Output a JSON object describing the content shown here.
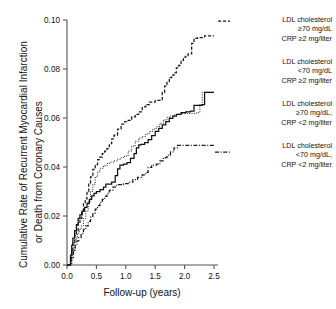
{
  "chart_data": {
    "type": "line",
    "title": "",
    "xlabel": "Follow-up (years)",
    "ylabel": "Cumulative Rate of Recurrent Myocardial Infarction or Death from Coronary Causes",
    "ylabel_line1": "Cumulative Rate of Recurrent Myocardial Infarction",
    "ylabel_line2": "or Death from Coronary Causes",
    "xlim": [
      0.0,
      2.5
    ],
    "ylim": [
      0.0,
      0.1
    ],
    "xticks": [
      "0.0",
      "0.5",
      "1.0",
      "1.5",
      "2.0",
      "2.5"
    ],
    "xtick_values": [
      0.0,
      0.5,
      1.0,
      1.5,
      2.0,
      2.5
    ],
    "yticks": [
      "0.00",
      "0.02",
      "0.04",
      "0.06",
      "0.08",
      "0.10"
    ],
    "ytick_values": [
      0.0,
      0.02,
      0.04,
      0.06,
      0.08,
      0.1
    ],
    "grid": false,
    "legend_position": "right",
    "series": [
      {
        "name": "LDL cholesterol >=70 mg/dL CRP >=2 mg/liter",
        "label_lines": [
          "LDL cholesterol",
          "≥70 mg/dL",
          "CRP ≥2 mg/liter"
        ],
        "style": "dashed",
        "color": "#1a1a1a",
        "final_value": 0.0935,
        "points": [
          [
            0.0,
            0.0
          ],
          [
            0.04,
            0.0
          ],
          [
            0.06,
            0.003
          ],
          [
            0.08,
            0.006
          ],
          [
            0.1,
            0.009
          ],
          [
            0.13,
            0.012
          ],
          [
            0.16,
            0.014
          ],
          [
            0.19,
            0.017
          ],
          [
            0.22,
            0.019
          ],
          [
            0.25,
            0.022
          ],
          [
            0.28,
            0.025
          ],
          [
            0.31,
            0.027
          ],
          [
            0.34,
            0.03
          ],
          [
            0.37,
            0.033
          ],
          [
            0.4,
            0.036
          ],
          [
            0.44,
            0.039
          ],
          [
            0.48,
            0.041
          ],
          [
            0.52,
            0.043
          ],
          [
            0.56,
            0.044
          ],
          [
            0.6,
            0.0455
          ],
          [
            0.64,
            0.0465
          ],
          [
            0.68,
            0.0475
          ],
          [
            0.72,
            0.0495
          ],
          [
            0.76,
            0.0515
          ],
          [
            0.8,
            0.053
          ],
          [
            0.86,
            0.0555
          ],
          [
            0.92,
            0.0575
          ],
          [
            0.98,
            0.0585
          ],
          [
            1.04,
            0.059
          ],
          [
            1.1,
            0.0605
          ],
          [
            1.16,
            0.0615
          ],
          [
            1.22,
            0.0625
          ],
          [
            1.28,
            0.0645
          ],
          [
            1.34,
            0.0655
          ],
          [
            1.4,
            0.0665
          ],
          [
            1.5,
            0.0672
          ],
          [
            1.58,
            0.0672
          ],
          [
            1.62,
            0.0705
          ],
          [
            1.66,
            0.073
          ],
          [
            1.7,
            0.0745
          ],
          [
            1.74,
            0.0765
          ],
          [
            1.78,
            0.0775
          ],
          [
            1.82,
            0.0785
          ],
          [
            1.86,
            0.0805
          ],
          [
            1.9,
            0.0815
          ],
          [
            1.94,
            0.0835
          ],
          [
            1.98,
            0.0848
          ],
          [
            2.02,
            0.0852
          ],
          [
            2.06,
            0.0862
          ],
          [
            2.1,
            0.0862
          ],
          [
            2.12,
            0.0905
          ],
          [
            2.16,
            0.0925
          ],
          [
            2.22,
            0.0928
          ],
          [
            2.3,
            0.0928
          ],
          [
            2.34,
            0.0935
          ],
          [
            2.5,
            0.0935
          ]
        ]
      },
      {
        "name": "LDL cholesterol <70 mg/dL CRP >=2 mg/liter",
        "label_lines": [
          "LDL cholesterol",
          "<70 mg/dL",
          "CRP ≥2 mg/liter"
        ],
        "style": "dotted",
        "color": "#1a1a1a",
        "final_value": 0.0705,
        "points": [
          [
            0.0,
            0.0
          ],
          [
            0.05,
            0.0
          ],
          [
            0.07,
            0.003
          ],
          [
            0.09,
            0.006
          ],
          [
            0.12,
            0.009
          ],
          [
            0.15,
            0.011
          ],
          [
            0.18,
            0.013
          ],
          [
            0.21,
            0.0145
          ],
          [
            0.24,
            0.016
          ],
          [
            0.28,
            0.019
          ],
          [
            0.32,
            0.022
          ],
          [
            0.36,
            0.026
          ],
          [
            0.4,
            0.03
          ],
          [
            0.44,
            0.033
          ],
          [
            0.48,
            0.036
          ],
          [
            0.52,
            0.038
          ],
          [
            0.56,
            0.0395
          ],
          [
            0.62,
            0.0405
          ],
          [
            0.68,
            0.0415
          ],
          [
            0.74,
            0.042
          ],
          [
            0.8,
            0.0425
          ],
          [
            0.86,
            0.0432
          ],
          [
            0.92,
            0.0438
          ],
          [
            0.98,
            0.0445
          ],
          [
            1.04,
            0.0465
          ],
          [
            1.1,
            0.0485
          ],
          [
            1.16,
            0.0505
          ],
          [
            1.22,
            0.0518
          ],
          [
            1.28,
            0.0525
          ],
          [
            1.34,
            0.0535
          ],
          [
            1.4,
            0.0545
          ],
          [
            1.46,
            0.0555
          ],
          [
            1.52,
            0.0565
          ],
          [
            1.58,
            0.0578
          ],
          [
            1.64,
            0.0592
          ],
          [
            1.7,
            0.0602
          ],
          [
            1.76,
            0.0608
          ],
          [
            1.82,
            0.0612
          ],
          [
            1.88,
            0.0615
          ],
          [
            1.96,
            0.0618
          ],
          [
            2.04,
            0.0618
          ],
          [
            2.12,
            0.0618
          ],
          [
            2.2,
            0.0622
          ],
          [
            2.26,
            0.0655
          ],
          [
            2.3,
            0.0705
          ],
          [
            2.5,
            0.0705
          ]
        ]
      },
      {
        "name": "LDL cholesterol >=70 mg/dL, CRP <2 mg/liter",
        "label_lines": [
          "LDL cholesterol",
          "≥70 mg/dL,",
          "CRP <2 mg/liter"
        ],
        "style": "solid",
        "color": "#111111",
        "final_value": 0.0705,
        "points": [
          [
            0.0,
            0.0
          ],
          [
            0.04,
            0.0
          ],
          [
            0.06,
            0.004
          ],
          [
            0.08,
            0.008
          ],
          [
            0.1,
            0.011
          ],
          [
            0.13,
            0.014
          ],
          [
            0.16,
            0.0165
          ],
          [
            0.19,
            0.019
          ],
          [
            0.22,
            0.0205
          ],
          [
            0.26,
            0.022
          ],
          [
            0.3,
            0.0235
          ],
          [
            0.34,
            0.0252
          ],
          [
            0.38,
            0.0268
          ],
          [
            0.42,
            0.0282
          ],
          [
            0.46,
            0.0292
          ],
          [
            0.5,
            0.03
          ],
          [
            0.56,
            0.0308
          ],
          [
            0.62,
            0.0318
          ],
          [
            0.66,
            0.033
          ],
          [
            0.7,
            0.033
          ],
          [
            0.76,
            0.0338
          ],
          [
            0.82,
            0.0365
          ],
          [
            0.86,
            0.0392
          ],
          [
            0.9,
            0.0408
          ],
          [
            0.96,
            0.0412
          ],
          [
            1.02,
            0.0418
          ],
          [
            1.08,
            0.0435
          ],
          [
            1.14,
            0.0455
          ],
          [
            1.18,
            0.0478
          ],
          [
            1.22,
            0.049
          ],
          [
            1.26,
            0.0492
          ],
          [
            1.32,
            0.05
          ],
          [
            1.38,
            0.0512
          ],
          [
            1.44,
            0.0528
          ],
          [
            1.5,
            0.0545
          ],
          [
            1.56,
            0.0558
          ],
          [
            1.62,
            0.0572
          ],
          [
            1.68,
            0.0585
          ],
          [
            1.74,
            0.0598
          ],
          [
            1.8,
            0.0608
          ],
          [
            1.86,
            0.0615
          ],
          [
            1.94,
            0.0622
          ],
          [
            2.02,
            0.0625
          ],
          [
            2.1,
            0.0628
          ],
          [
            2.16,
            0.0652
          ],
          [
            2.22,
            0.0652
          ],
          [
            2.3,
            0.0655
          ],
          [
            2.34,
            0.0705
          ],
          [
            2.5,
            0.0705
          ]
        ]
      },
      {
        "name": "LDL cholesterol <70 mg/dL, CRP <2 mg/liter",
        "label_lines": [
          "LDL cholesterol",
          "<70 mg/dL,",
          "CRP <2 mg/liter"
        ],
        "style": "dashdot",
        "color": "#1a1a1a",
        "final_value": 0.0488,
        "points": [
          [
            0.0,
            0.0
          ],
          [
            0.06,
            0.0
          ],
          [
            0.08,
            0.003
          ],
          [
            0.11,
            0.006
          ],
          [
            0.14,
            0.008
          ],
          [
            0.17,
            0.0098
          ],
          [
            0.2,
            0.0112
          ],
          [
            0.24,
            0.0128
          ],
          [
            0.28,
            0.0145
          ],
          [
            0.32,
            0.016
          ],
          [
            0.36,
            0.0178
          ],
          [
            0.4,
            0.0195
          ],
          [
            0.44,
            0.0212
          ],
          [
            0.48,
            0.0228
          ],
          [
            0.52,
            0.0242
          ],
          [
            0.56,
            0.0255
          ],
          [
            0.6,
            0.0268
          ],
          [
            0.64,
            0.028
          ],
          [
            0.68,
            0.0292
          ],
          [
            0.72,
            0.0305
          ],
          [
            0.78,
            0.0318
          ],
          [
            0.84,
            0.0328
          ],
          [
            0.9,
            0.0328
          ],
          [
            0.96,
            0.0332
          ],
          [
            1.04,
            0.0338
          ],
          [
            1.12,
            0.0348
          ],
          [
            1.2,
            0.0358
          ],
          [
            1.28,
            0.0368
          ],
          [
            1.34,
            0.0378
          ],
          [
            1.38,
            0.0398
          ],
          [
            1.44,
            0.0408
          ],
          [
            1.52,
            0.0412
          ],
          [
            1.58,
            0.0425
          ],
          [
            1.64,
            0.0438
          ],
          [
            1.7,
            0.0448
          ],
          [
            1.76,
            0.0462
          ],
          [
            1.82,
            0.0478
          ],
          [
            1.88,
            0.0488
          ],
          [
            2.0,
            0.0488
          ],
          [
            2.2,
            0.0488
          ],
          [
            2.5,
            0.0488
          ]
        ]
      }
    ]
  }
}
